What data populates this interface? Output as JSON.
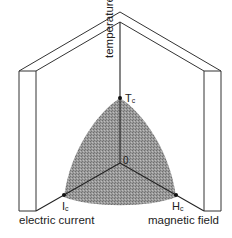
{
  "diagram": {
    "axes": {
      "temperature": "temperature",
      "electric_current": "electric current",
      "magnetic_field": "magnetic field"
    },
    "points": {
      "critical_temperature": {
        "symbol": "T",
        "subscript": "c"
      },
      "critical_current": {
        "symbol": "I",
        "subscript": "c"
      },
      "critical_field": {
        "symbol": "H",
        "subscript": "c"
      },
      "origin": "0"
    },
    "colors": {
      "region_fill": "#8f8f8f",
      "line": "#2a2a2a",
      "background": "#ffffff"
    }
  }
}
